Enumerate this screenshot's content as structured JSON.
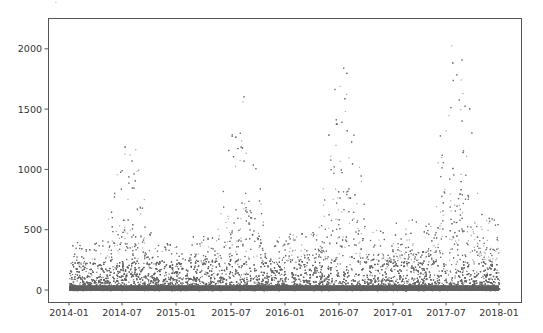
{
  "figure": {
    "width": 543,
    "height": 333,
    "background": "#ffffff",
    "point_color": "#606060",
    "frame_color": "#555555"
  },
  "chart_data": {
    "type": "scatter",
    "title": "",
    "xlabel": "",
    "ylabel": "",
    "grid": false,
    "legend": null,
    "x_range": [
      "2013-11-20",
      "2018-02-10"
    ],
    "ylim": [
      -100,
      2250
    ],
    "x_ticks": [
      "2014-01",
      "2014-07",
      "2015-01",
      "2015-07",
      "2016-01",
      "2016-07",
      "2017-01",
      "2017-07",
      "2018-01"
    ],
    "y_ticks": [
      0,
      500,
      1000,
      1500,
      2000
    ],
    "data_span": [
      "2014-01-01",
      "2017-12-31"
    ],
    "seasonal_envelope": [
      {
        "year": 2014,
        "peak_month": "2014-07",
        "approx_max": 1320,
        "dense_core_max": 600,
        "winter_max": 400
      },
      {
        "year": 2015,
        "peak_month": "2015-08",
        "approx_max": 1620,
        "dense_core_max": 750,
        "winter_max": 450
      },
      {
        "year": 2016,
        "peak_month": "2016-07",
        "approx_max": 1880,
        "dense_core_max": 900,
        "winter_max": 500
      },
      {
        "year": 2017,
        "peak_month": "2017-08",
        "approx_max": 2160,
        "dense_core_max": 1050,
        "winter_max": 600
      }
    ]
  },
  "layout": {
    "plot_left": 48,
    "plot_top": 18,
    "plot_right": 521,
    "plot_bottom": 302,
    "y0_px": 290,
    "y_px_per_unit": 0.1206,
    "x_tick_px": [
      69,
      122,
      176,
      231,
      285,
      339,
      393,
      446,
      499
    ]
  }
}
